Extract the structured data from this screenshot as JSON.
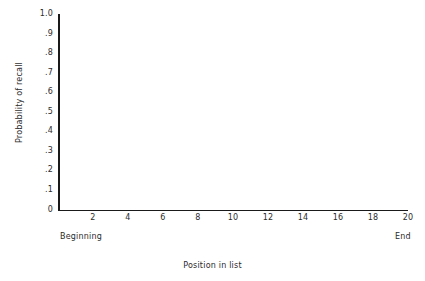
{
  "chart_data": {
    "type": "line",
    "title": "",
    "subtitle": "",
    "xlabel": "Position in list",
    "ylabel": "Probability of recall",
    "xlim": [
      0,
      20
    ],
    "ylim": [
      0,
      1.0
    ],
    "grid": false,
    "legend": null,
    "series": [],
    "values": [],
    "x": [],
    "categories": [],
    "note": "Empty axes template — no data points are plotted in the figure.",
    "y_ticks": [
      {
        "value": 1.0,
        "label": "1.0"
      },
      {
        "value": 0.9,
        "label": ".9"
      },
      {
        "value": 0.8,
        "label": ".8"
      },
      {
        "value": 0.7,
        "label": ".7"
      },
      {
        "value": 0.6,
        "label": ".6"
      },
      {
        "value": 0.5,
        "label": ".5"
      },
      {
        "value": 0.4,
        "label": ".4"
      },
      {
        "value": 0.3,
        "label": ".3"
      },
      {
        "value": 0.2,
        "label": ".2"
      },
      {
        "value": 0.1,
        "label": ".1"
      },
      {
        "value": 0.0,
        "label": "0"
      }
    ],
    "x_ticks": [
      {
        "value": 2,
        "label": "2"
      },
      {
        "value": 4,
        "label": "4"
      },
      {
        "value": 6,
        "label": "6"
      },
      {
        "value": 8,
        "label": "8"
      },
      {
        "value": 10,
        "label": "10"
      },
      {
        "value": 12,
        "label": "12"
      },
      {
        "value": 14,
        "label": "14"
      },
      {
        "value": 16,
        "label": "16"
      },
      {
        "value": 18,
        "label": "18"
      },
      {
        "value": 20,
        "label": "20"
      }
    ],
    "annotations": [
      {
        "name": "x-axis-start-caption",
        "text": "Beginning",
        "at_x": 0
      },
      {
        "name": "x-axis-end-caption",
        "text": "End",
        "at_x": 20
      }
    ],
    "colors": {
      "background": "#ffffff",
      "axis": "#1a1a1a",
      "text": "#2b2b2b"
    }
  }
}
